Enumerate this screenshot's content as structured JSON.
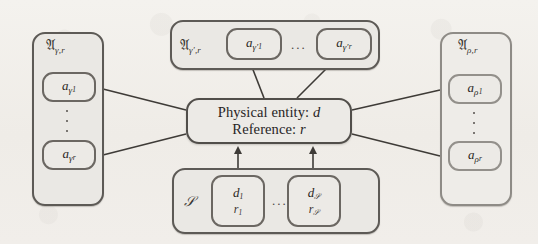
{
  "diagram": {
    "background_color": "#f1eeea",
    "stroke_color": "#5d5a56",
    "node_fill": "#eceae6",
    "group_fill": "#eae8e4",
    "ellipsis": "...",
    "vertical_ellipsis": "⋮"
  },
  "center": {
    "name": "physical-entity-box",
    "line1_label": "Physical entity:",
    "line1_value": "d",
    "line2_label": "Reference:",
    "line2_value": "r"
  },
  "groups": {
    "left": {
      "name": "gamma-group",
      "label_symbol": "𝔄",
      "label_subscript": "γ,r",
      "nodes": [
        {
          "base": "a",
          "sub": "γ",
          "sub2": "1"
        },
        {
          "base": "a",
          "sub": "γ",
          "sub2": "r"
        }
      ]
    },
    "top": {
      "name": "gamma-prime-group",
      "label_symbol": "𝔄",
      "label_subscript": "γ′,r",
      "nodes": [
        {
          "base": "a",
          "sub": "γ′",
          "sub2": "1"
        },
        {
          "base": "a",
          "sub": "γ′",
          "sub2": "r"
        }
      ]
    },
    "right": {
      "name": "rho-group",
      "label_symbol": "𝔄",
      "label_subscript": "ρ,r",
      "nodes": [
        {
          "base": "a",
          "sub": "ρ",
          "sub2": "1"
        },
        {
          "base": "a",
          "sub": "ρ",
          "sub2": "r"
        }
      ]
    },
    "bottom": {
      "name": "source-group",
      "label_symbol": "𝒮",
      "nodes": [
        {
          "top_base": "d",
          "top_sub": "1",
          "bot_base": "r",
          "bot_sub": "1"
        },
        {
          "top_base": "d",
          "top_sub": "𝒮",
          "bot_base": "r",
          "bot_sub": "𝒮"
        }
      ]
    }
  },
  "edges": {
    "description": "plain lines from left and right group nodes and top group nodes to center; arrows from bottom group nodes up into center",
    "arrow_direction": "up"
  }
}
